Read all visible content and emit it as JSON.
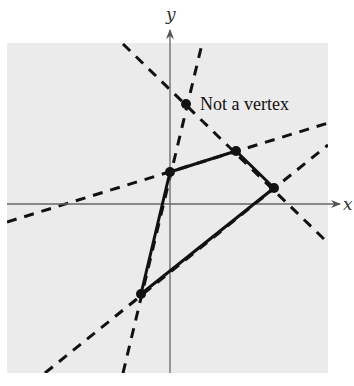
{
  "diagram": {
    "axes": {
      "x_label": "x",
      "y_label": "y",
      "origin_px": [
        170,
        204
      ]
    },
    "region_background": "#ebebeb",
    "vertices": [
      {
        "id": "A",
        "px": [
          170,
          172
        ]
      },
      {
        "id": "B",
        "px": [
          236,
          151
        ]
      },
      {
        "id": "C",
        "px": [
          274,
          188
        ]
      },
      {
        "id": "D",
        "px": [
          141,
          294
        ]
      }
    ],
    "non_vertex_point": {
      "px": [
        186,
        104
      ],
      "label": "Not a vertex"
    },
    "boundary_lines": [
      {
        "name": "line-AB",
        "from": [
          7,
          222
        ],
        "to": [
          328,
          123
        ]
      },
      {
        "name": "line-DC",
        "from": [
          45,
          373
        ],
        "to": [
          328,
          145
        ]
      },
      {
        "name": "line-steep",
        "from": [
          123,
          373
        ],
        "to": [
          202,
          44
        ]
      },
      {
        "name": "line-negative",
        "from": [
          123,
          44
        ],
        "to": [
          325,
          240
        ]
      }
    ]
  }
}
